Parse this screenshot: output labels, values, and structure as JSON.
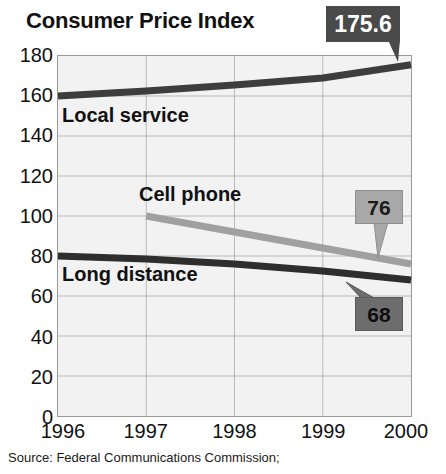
{
  "chart_data": {
    "type": "line",
    "title": "Consumer Price Index",
    "xlabel": "",
    "ylabel": "",
    "x": [
      1996,
      1997,
      1998,
      1999,
      2000
    ],
    "xticklabels": [
      "1996",
      "1997",
      "1998",
      "1999",
      "2000"
    ],
    "xlim": [
      1996,
      2000
    ],
    "ylim": [
      0,
      180
    ],
    "yticks": [
      0,
      20,
      40,
      60,
      80,
      100,
      120,
      140,
      160,
      180
    ],
    "yticklabels": [
      "0",
      "20",
      "40",
      "60",
      "80",
      "100",
      "120",
      "140",
      "160",
      "180"
    ],
    "grid": true,
    "legend_position": "inline-labels",
    "series": [
      {
        "name": "Local service",
        "color": "#3d3d3d",
        "x": [
          1996,
          1997,
          1998,
          1999,
          2000
        ],
        "values": [
          160.0,
          162.5,
          165.5,
          169.0,
          175.6
        ]
      },
      {
        "name": "Cell phone",
        "color": "#a0a0a0",
        "x": [
          1997,
          1998,
          1999,
          2000
        ],
        "values": [
          100.0,
          92.0,
          84.0,
          76.0
        ]
      },
      {
        "name": "Long distance",
        "color": "#2e2e2e",
        "x": [
          1996,
          1997,
          1998,
          1999,
          2000
        ],
        "values": [
          80.0,
          78.5,
          76.0,
          72.5,
          68.0
        ]
      }
    ],
    "annotations": [
      {
        "id": "175.6",
        "label": "175.6",
        "series": "Local service",
        "value": 175.6,
        "at_x": 2000,
        "style": "dark"
      },
      {
        "id": "76",
        "label": "76",
        "series": "Cell phone",
        "value": 76,
        "at_x": 2000,
        "style": "light-gray"
      },
      {
        "id": "68",
        "label": "68",
        "series": "Long distance",
        "value": 68,
        "at_x": 2000,
        "style": "mid-gray"
      }
    ],
    "source": "Source: Federal Communications Commission;"
  },
  "labels": {
    "local_service": "Local service",
    "cell_phone": "Cell phone",
    "long_distance": "Long distance"
  },
  "colors": {
    "local_service": "#3d3d3d",
    "cell_phone": "#a0a0a0",
    "long_distance": "#2e2e2e",
    "plot_background": "#f2f2f2",
    "gridline": "#b9b9b9",
    "frame": "#9a9a9a",
    "callout_dark": "#4a4a4a",
    "callout_mid": "#6d6d6d",
    "callout_light": "#a8a8a8"
  }
}
